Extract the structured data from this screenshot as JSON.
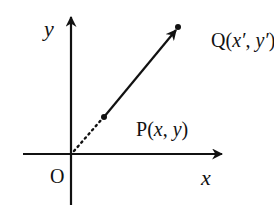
{
  "diagram": {
    "axes": {
      "x_label": "x",
      "y_label": "y",
      "origin_label": "O"
    },
    "points": {
      "P": {
        "name": "P",
        "open": "(",
        "x": "x",
        "sep": ", ",
        "y": "y",
        "close": ")"
      },
      "Q": {
        "name": "Q",
        "open": "(",
        "x": "x′",
        "sep": ", ",
        "y": "y′",
        "close": ")"
      }
    },
    "segments": [
      {
        "from": "O",
        "to": "P",
        "style": "dotted"
      },
      {
        "from": "P",
        "to": "Q",
        "style": "solid-arrow"
      }
    ],
    "colors": {
      "ink": "#111111",
      "background": "#ffffff"
    }
  }
}
